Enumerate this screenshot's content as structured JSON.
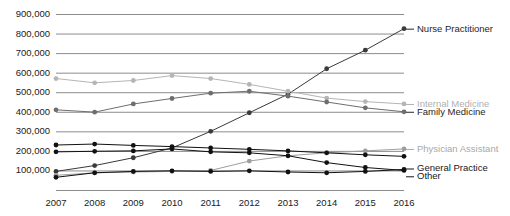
{
  "chart_data": {
    "type": "line",
    "title": "",
    "subtitle": "",
    "xlabel": "",
    "ylabel": "",
    "grid": true,
    "legend_position": "right-inline-labels",
    "x": [
      2007,
      2008,
      2009,
      2010,
      2011,
      2012,
      2013,
      2014,
      2015,
      2016
    ],
    "categories": [
      "2007",
      "2008",
      "2009",
      "2010",
      "2011",
      "2012",
      "2013",
      "2014",
      "2015",
      "2016"
    ],
    "ylim": [
      0,
      900000
    ],
    "xlim": [
      2007,
      2016
    ],
    "ytick_labels": [
      "900,000",
      "800,000",
      "700,000",
      "600,000",
      "500,000",
      "400,000",
      "300,000",
      "200,000",
      "100,000"
    ],
    "ytick_values": [
      900000,
      800000,
      700000,
      600000,
      500000,
      400000,
      300000,
      200000,
      100000
    ],
    "series": [
      {
        "name": "Nurse Practitioner",
        "color": "#3a3a3a",
        "label_color": "#262626",
        "values": [
          95000,
          125000,
          165000,
          215000,
          300000,
          395000,
          490000,
          620000,
          715000,
          825000
        ]
      },
      {
        "name": "Internal Medicine",
        "color": "#b5b5b5",
        "label_color": "#b0b0b0",
        "values": [
          570000,
          548000,
          560000,
          585000,
          570000,
          540000,
          505000,
          470000,
          452000,
          440000
        ]
      },
      {
        "name": "Family Medicine",
        "color": "#6e6e6e",
        "label_color": "#262626",
        "values": [
          410000,
          398000,
          440000,
          468000,
          495000,
          505000,
          480000,
          450000,
          420000,
          400000
        ]
      },
      {
        "name": "Physician Assistant",
        "color": "#9e9e9e",
        "label_color": "#a8a8a8",
        "values": [
          75000,
          88000,
          92000,
          95000,
          100000,
          148000,
          175000,
          190000,
          200000,
          210000
        ]
      },
      {
        "name": "General Practice",
        "color": "#111111",
        "label_color": "#161616",
        "values": [
          195000,
          198000,
          200000,
          210000,
          195000,
          190000,
          175000,
          140000,
          115000,
          100000
        ]
      },
      {
        "name": "Other",
        "color": "#111111",
        "label_color": "#161616",
        "values": [
          65000,
          88000,
          95000,
          98000,
          95000,
          98000,
          92000,
          88000,
          95000,
          105000
        ]
      },
      {
        "name": "Secondary Lower",
        "color": "#111111",
        "label_color": "#161616",
        "values": [
          230000,
          235000,
          228000,
          222000,
          215000,
          208000,
          200000,
          190000,
          180000,
          172000
        ]
      }
    ],
    "series_labels": [
      {
        "name": "Nurse Practitioner",
        "value": 825000,
        "color": "#262626"
      },
      {
        "name": "Internal Medicine",
        "value": 440000,
        "color": "#b0b0b0"
      },
      {
        "name": "Family Medicine",
        "value": 400000,
        "color": "#262626"
      },
      {
        "name": "Physician Assistant",
        "value": 210000,
        "color": "#a8a8a8"
      },
      {
        "name": "General Practice",
        "value": 110000,
        "color": "#161616"
      },
      {
        "name": "Other",
        "value": 70000,
        "color": "#161616"
      }
    ]
  },
  "colors": {
    "gridline": "#8c8c8c",
    "axis_text": "#1a1a1a",
    "background": "#ffffff"
  }
}
